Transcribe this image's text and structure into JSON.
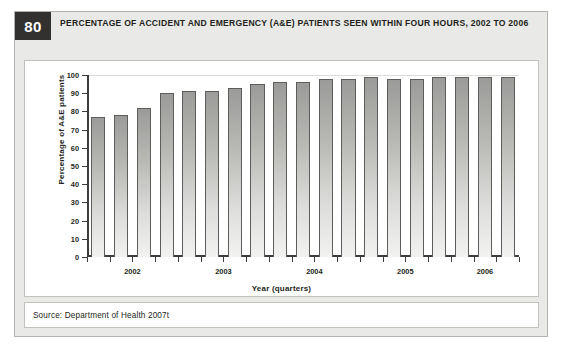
{
  "figure": {
    "number": "80",
    "title": "PERCENTAGE OF ACCIDENT AND EMERGENCY (A&E) PATIENTS SEEN WITHIN FOUR HOURS, 2002 TO 2006",
    "source": "Source: Department of Health 2007t"
  },
  "chart_data": {
    "type": "bar",
    "title": "PERCENTAGE OF ACCIDENT AND EMERGENCY (A&E) PATIENTS SEEN WITHIN FOUR HOURS, 2002 TO 2006",
    "xlabel": "Year (quarters)",
    "ylabel": "Percentage of A&E patients",
    "ylim": [
      0,
      100
    ],
    "ytick_labels": [
      "100",
      "90",
      "80",
      "70",
      "60",
      "50",
      "40",
      "30",
      "20",
      "10",
      "0"
    ],
    "ytick_values": [
      100,
      90,
      80,
      70,
      60,
      50,
      40,
      30,
      20,
      10,
      0
    ],
    "grid": false,
    "legend": false,
    "group_labels": [
      "2002",
      "2003",
      "2004",
      "2005",
      "2006"
    ],
    "categories": [
      "2002 Q1",
      "2002 Q2",
      "2002 Q3",
      "2002 Q4",
      "2003 Q1",
      "2003 Q2",
      "2003 Q3",
      "2003 Q4",
      "2004 Q1",
      "2004 Q2",
      "2004 Q3",
      "2004 Q4",
      "2005 Q1",
      "2005 Q2",
      "2005 Q3",
      "2005 Q4",
      "2006 Q1",
      "2006 Q2",
      "2006 Q3"
    ],
    "values": [
      77,
      78,
      82,
      90,
      91,
      91,
      93,
      95,
      96,
      96,
      98,
      98,
      99,
      98,
      98,
      99,
      99,
      99,
      99
    ]
  }
}
